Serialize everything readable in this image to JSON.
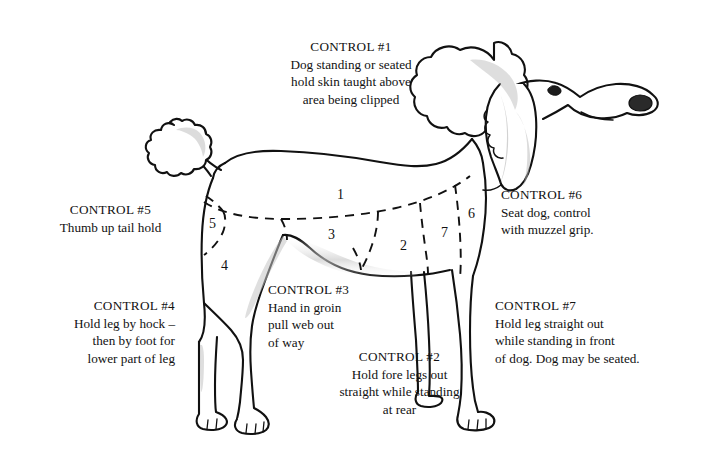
{
  "document": {
    "title": "Poodle Grooming Control Points Diagram",
    "subject": "dog-grooming-control-points",
    "background_color": "#ffffff",
    "ink_color": "#111111"
  },
  "callouts": [
    {
      "id": "control-1",
      "title": "CONTROL #1",
      "lines": [
        "Dog standing or seated",
        "hold skin taught above",
        "area being clipped"
      ],
      "align": "center"
    },
    {
      "id": "control-2",
      "title": "CONTROL #2",
      "lines": [
        "Hold fore legs out",
        "straight while standing",
        "at rear"
      ],
      "align": "center"
    },
    {
      "id": "control-3",
      "title": "CONTROL #3",
      "lines": [
        "Hand in groin",
        "pull web out",
        "of way"
      ],
      "align": "left"
    },
    {
      "id": "control-4",
      "title": "CONTROL #4",
      "lines": [
        "Hold leg by hock –",
        "then by foot for",
        "lower part of leg"
      ],
      "align": "right"
    },
    {
      "id": "control-5",
      "title": "CONTROL #5",
      "lines": [
        "Thumb up tail hold"
      ],
      "align": "center"
    },
    {
      "id": "control-6",
      "title": "CONTROL #6",
      "lines": [
        "Seat dog, control",
        "with muzzel grip."
      ],
      "align": "left"
    },
    {
      "id": "control-7",
      "title": "CONTROL #7",
      "lines": [
        "Hold leg straight out",
        "while standing in front",
        "of dog. Dog may be seated."
      ],
      "align": "left"
    }
  ],
  "region_numbers": [
    {
      "label": "1",
      "x": 337,
      "y": 187
    },
    {
      "label": "2",
      "x": 400,
      "y": 238
    },
    {
      "label": "3",
      "x": 328,
      "y": 227
    },
    {
      "label": "4",
      "x": 221,
      "y": 258
    },
    {
      "label": "5",
      "x": 209,
      "y": 216
    },
    {
      "label": "6",
      "x": 468,
      "y": 206
    },
    {
      "label": "7",
      "x": 441,
      "y": 225
    }
  ],
  "figure": {
    "name": "standing-poodle-side-view",
    "features": [
      "topknot",
      "drop-ear",
      "muzzle",
      "tail-pompom",
      "four-legs",
      "dashed-region-boundaries"
    ]
  }
}
